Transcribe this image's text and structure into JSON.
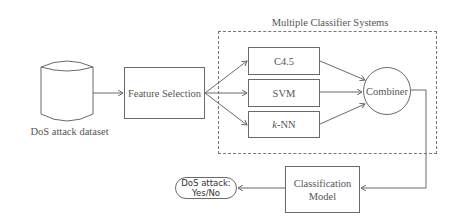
{
  "diagram": {
    "dataset": {
      "label": "DoS attack dataset",
      "shape": "cylinder"
    },
    "feature_selection": {
      "label": "Feature Selection"
    },
    "mcs_group": {
      "title": "Multiple Classifier Systems"
    },
    "classifiers": [
      {
        "label": "C4.5"
      },
      {
        "label": "SVM"
      },
      {
        "label_italic": "k",
        "label_rest": "-NN"
      }
    ],
    "combiner": {
      "label": "Combiner"
    },
    "classification_model": {
      "line1": "Classification",
      "line2": "Model"
    },
    "output": {
      "line1": "DoS attack:",
      "line2": "Yes/No"
    },
    "colors": {
      "stroke": "#6a6a6a",
      "text": "#555555",
      "dashed": "#777777"
    }
  }
}
